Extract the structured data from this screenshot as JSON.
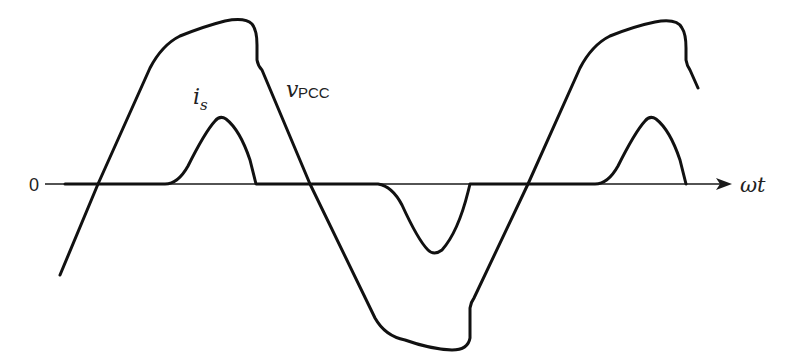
{
  "diagram": {
    "title": "",
    "type": "waveform",
    "axis": {
      "origin_label": "0",
      "x_label": "ωt"
    },
    "curves": [
      {
        "id": "v_pcc",
        "label_main": "v",
        "label_sub": "PCC",
        "description": "Voltage at point of common coupling, flat-topped (clipped) sinusoid"
      },
      {
        "id": "i_s",
        "label_main": "i",
        "label_sub": "s",
        "description": "Source current, narrow pulses near voltage peaks (positive, negative, positive)"
      }
    ],
    "colors": {
      "line": "#111111",
      "background": "#ffffff"
    }
  }
}
